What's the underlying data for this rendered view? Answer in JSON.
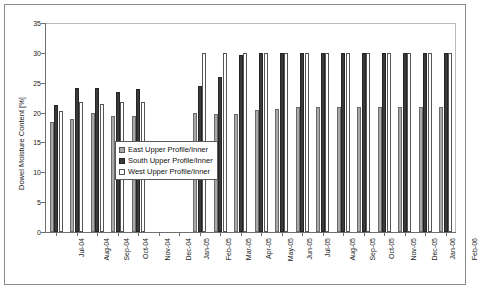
{
  "chart_data": {
    "type": "bar",
    "title": "",
    "xlabel": "",
    "ylabel": "Dowel Moisture Content [%]",
    "ylim": [
      0,
      35
    ],
    "yticks": [
      0,
      5,
      10,
      15,
      20,
      25,
      30,
      35
    ],
    "grid": false,
    "legend_position": "inside-left",
    "categories": [
      "Jul-04",
      "Aug-04",
      "Sep-04",
      "Oct-04",
      "Nov-04",
      "Dec-04",
      "Jan-05",
      "Feb-05",
      "Mar-05",
      "Apr-05",
      "May-05",
      "Jun-05",
      "Jul-05",
      "Aug-05",
      "Sep-05",
      "Oct-05",
      "Nov-05",
      "Dec-05",
      "Jan-06",
      "Feb-06"
    ],
    "series": [
      {
        "name": "East Upper Profile/Inner",
        "color": "#a9a9a9",
        "values": [
          18.4,
          19.0,
          20.0,
          19.5,
          19.4,
          null,
          null,
          19.9,
          19.7,
          19.7,
          20.4,
          20.6,
          20.9,
          20.9,
          21.0,
          20.9,
          21.0,
          21.0,
          21.0,
          21.0
        ]
      },
      {
        "name": "South Upper Profile/Inner",
        "color": "#3a3a3a",
        "values": [
          21.2,
          24.1,
          24.1,
          23.5,
          23.9,
          null,
          null,
          24.5,
          26.0,
          29.6,
          29.9,
          30.0,
          30.0,
          30.0,
          30.0,
          30.0,
          30.0,
          30.0,
          30.0,
          29.9
        ]
      },
      {
        "name": "West Upper Profile/Inner",
        "color": "#ffffff",
        "values": [
          20.3,
          21.8,
          21.5,
          21.7,
          21.8,
          null,
          null,
          29.9,
          29.9,
          29.9,
          30.0,
          30.0,
          30.0,
          30.0,
          30.0,
          30.0,
          30.0,
          30.0,
          30.0,
          30.0
        ]
      }
    ]
  }
}
